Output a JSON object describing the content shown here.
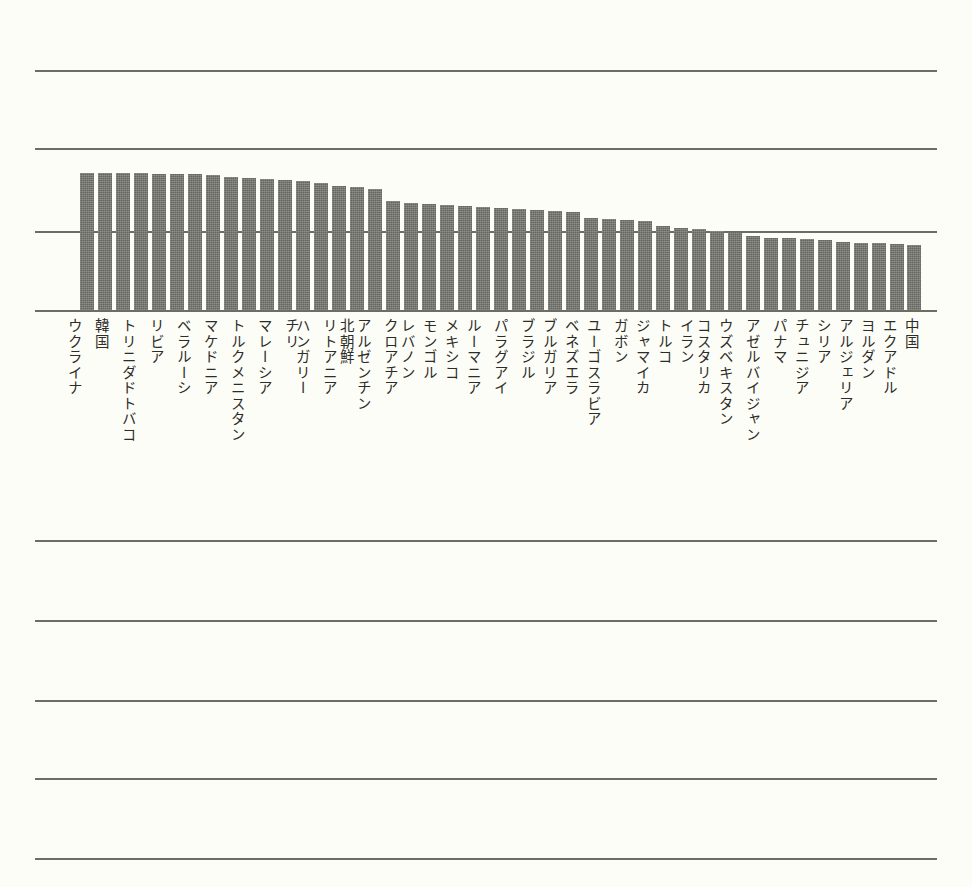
{
  "chart_data": {
    "type": "bar",
    "title": "",
    "subtitle": "",
    "xlabel": "",
    "ylabel": "",
    "legend": [],
    "grid": true,
    "grid_orientation": "horizontal",
    "legend_position": "none",
    "bar_color": "#6f6f69",
    "background_color": "#fdfdf7",
    "gridline_color": "#6d6d66",
    "label_color": "#2c2c28",
    "label_orientation": "vertical-upright",
    "baseline_y_px": 310,
    "gridlines_y_px": [
      70,
      148,
      231,
      310,
      540,
      620,
      700,
      778,
      858
    ],
    "ylim": [
      0,
      1.75
    ],
    "categories": [
      "ウクライナ",
      "韓国",
      "トリニダドトバコ",
      "リビア",
      "ベラルーシ",
      "マケドニア",
      "トルクメニスタン",
      "マレーシア",
      "チリ",
      "ハンガリー",
      "リトアニア",
      "北朝鮮",
      "アルゼンチン",
      "クロアチア",
      "レバノン",
      "モンゴル",
      "メキシコ",
      "ルーマニア",
      "パラグアイ",
      "ブラジル",
      "ブルガリア",
      "ベネズエラ",
      "ユーゴスラビア",
      "ガボン",
      "ジャマイカ",
      "トルコ",
      "イラン",
      "コスタリカ",
      "ウズベキスタン",
      "アゼルバイジャン",
      "パナマ",
      "チュニジア",
      "シリア",
      "アルジェリア",
      "ヨルダン",
      "エクアドル",
      "中国"
    ],
    "values": [
      1.7,
      1.7,
      1.7,
      1.7,
      1.69,
      1.69,
      1.69,
      1.68,
      1.66,
      1.65,
      1.64,
      1.63,
      1.62,
      1.52,
      1.5,
      1.49,
      1.48,
      1.47,
      1.46,
      1.45,
      1.44,
      1.43,
      1.38,
      1.36,
      1.34,
      1.3,
      1.29,
      1.26,
      1.24,
      1.21,
      1.2,
      1.19,
      1.18,
      1.17,
      1.16,
      1.16,
      1.15
    ],
    "bars_px": [
      {
        "x": 80,
        "w": 14,
        "top": 173
      },
      {
        "x": 98,
        "w": 14,
        "top": 173
      },
      {
        "x": 116,
        "w": 14,
        "top": 173
      },
      {
        "x": 134,
        "w": 14,
        "top": 173
      },
      {
        "x": 152,
        "w": 14,
        "top": 174
      },
      {
        "x": 170,
        "w": 14,
        "top": 174
      },
      {
        "x": 188,
        "w": 14,
        "top": 174
      },
      {
        "x": 206,
        "w": 14,
        "top": 175
      },
      {
        "x": 224,
        "w": 14,
        "top": 177
      },
      {
        "x": 242,
        "w": 14,
        "top": 178
      },
      {
        "x": 260,
        "w": 14,
        "top": 179
      },
      {
        "x": 278,
        "w": 14,
        "top": 180
      },
      {
        "x": 296,
        "w": 14,
        "top": 181
      },
      {
        "x": 314,
        "w": 14,
        "top": 183
      },
      {
        "x": 332,
        "w": 14,
        "top": 186
      },
      {
        "x": 350,
        "w": 14,
        "top": 187
      },
      {
        "x": 368,
        "w": 14,
        "top": 189
      },
      {
        "x": 386,
        "w": 14,
        "top": 201
      },
      {
        "x": 404,
        "w": 14,
        "top": 203
      },
      {
        "x": 422,
        "w": 14,
        "top": 204
      },
      {
        "x": 440,
        "w": 14,
        "top": 205
      },
      {
        "x": 458,
        "w": 14,
        "top": 206
      },
      {
        "x": 476,
        "w": 14,
        "top": 207
      },
      {
        "x": 494,
        "w": 14,
        "top": 208
      },
      {
        "x": 512,
        "w": 14,
        "top": 209
      },
      {
        "x": 530,
        "w": 14,
        "top": 210
      },
      {
        "x": 548,
        "w": 14,
        "top": 211
      },
      {
        "x": 566,
        "w": 14,
        "top": 212
      },
      {
        "x": 584,
        "w": 14,
        "top": 218
      },
      {
        "x": 602,
        "w": 14,
        "top": 219
      },
      {
        "x": 620,
        "w": 14,
        "top": 220
      },
      {
        "x": 638,
        "w": 14,
        "top": 221
      },
      {
        "x": 656,
        "w": 14,
        "top": 226
      },
      {
        "x": 674,
        "w": 14,
        "top": 228
      },
      {
        "x": 692,
        "w": 14,
        "top": 229
      },
      {
        "x": 710,
        "w": 14,
        "top": 231
      },
      {
        "x": 728,
        "w": 14,
        "top": 232
      },
      {
        "x": 746,
        "w": 14,
        "top": 236
      },
      {
        "x": 764,
        "w": 14,
        "top": 238
      },
      {
        "x": 782,
        "w": 14,
        "top": 238
      },
      {
        "x": 800,
        "w": 14,
        "top": 239
      },
      {
        "x": 818,
        "w": 14,
        "top": 240
      },
      {
        "x": 836,
        "w": 14,
        "top": 242
      },
      {
        "x": 854,
        "w": 14,
        "top": 243
      },
      {
        "x": 872,
        "w": 14,
        "top": 243
      },
      {
        "x": 890,
        "w": 14,
        "top": 244
      },
      {
        "x": 907,
        "w": 14,
        "top": 245
      }
    ],
    "labels_px": [
      {
        "x": 66,
        "text": "ウクライナ"
      },
      {
        "x": 93,
        "text": "韓国"
      },
      {
        "x": 120,
        "text": "トリニダドトバコ"
      },
      {
        "x": 148,
        "text": "リビア"
      },
      {
        "x": 175,
        "text": "ベラルーシ"
      },
      {
        "x": 202,
        "text": "マケドニア"
      },
      {
        "x": 229,
        "text": "トルクメニスタン"
      },
      {
        "x": 256,
        "text": "マレーシア"
      },
      {
        "x": 283,
        "text": "チリ"
      },
      {
        "x": 294,
        "text": "ハンガリー"
      },
      {
        "x": 321,
        "text": "リトアニア"
      },
      {
        "x": 338,
        "text": "北朝鮮"
      },
      {
        "x": 355,
        "text": "アルゼンチン"
      },
      {
        "x": 382,
        "text": "クロアチア"
      },
      {
        "x": 399,
        "text": "レバノン"
      },
      {
        "x": 421,
        "text": "モンゴル"
      },
      {
        "x": 443,
        "text": "メキシコ"
      },
      {
        "x": 465,
        "text": "ルーマニア"
      },
      {
        "x": 492,
        "text": "パラグアイ"
      },
      {
        "x": 519,
        "text": "ブラジル"
      },
      {
        "x": 541,
        "text": "ブルガリア"
      },
      {
        "x": 563,
        "text": "ベネズエラ"
      },
      {
        "x": 585,
        "text": "ユーゴスラビア"
      },
      {
        "x": 612,
        "text": "ガボン"
      },
      {
        "x": 634,
        "text": "ジャマイカ"
      },
      {
        "x": 656,
        "text": "トルコ"
      },
      {
        "x": 678,
        "text": "イラン"
      },
      {
        "x": 695,
        "text": "コスタリカ"
      },
      {
        "x": 717,
        "text": "ウズベキスタン"
      },
      {
        "x": 744,
        "text": "アゼルバイジャン"
      },
      {
        "x": 771,
        "text": "パナマ"
      },
      {
        "x": 793,
        "text": "チュニジア"
      },
      {
        "x": 815,
        "text": "シリア"
      },
      {
        "x": 837,
        "text": "アルジェリア"
      },
      {
        "x": 859,
        "text": "ヨルダン"
      },
      {
        "x": 881,
        "text": "エクアドル"
      },
      {
        "x": 903,
        "text": "中国"
      }
    ]
  }
}
